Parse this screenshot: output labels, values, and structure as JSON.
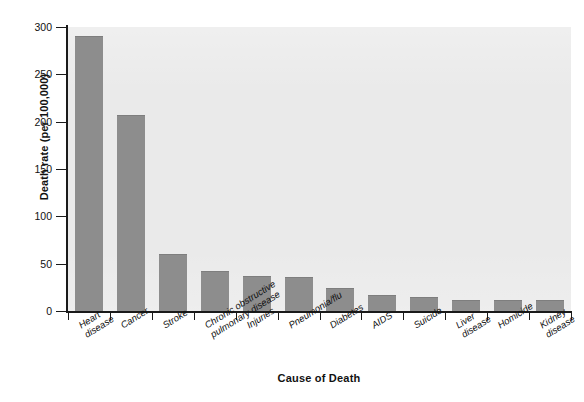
{
  "chart_data": {
    "type": "bar",
    "title": "",
    "xlabel": "Cause of Death",
    "ylabel": "Death rate (per 100,000)",
    "categories": [
      "Heart\ndisease",
      "Cancer",
      "Stroke",
      "Chronic obstructive\npulmonary disease",
      "Injuries",
      "Pneumonia/flu",
      "Diabetes",
      "AIDS",
      "Suicide",
      "Liver\ndisease",
      "Homicide",
      "Kidney\ndisease"
    ],
    "values": [
      290,
      207,
      60,
      42,
      37,
      36,
      24,
      17,
      15,
      12,
      12,
      12
    ],
    "ylim": [
      0,
      300
    ],
    "yticks": [
      0,
      50,
      100,
      150,
      200,
      250,
      300
    ],
    "ytick_labels": [
      "0",
      "50",
      "100",
      "150",
      "200",
      "250",
      "300"
    ],
    "grid": false,
    "legend": "none",
    "bar_color": "#8d8d8d",
    "plot_background": "#eaeaea",
    "axis_color": "#1a1a1a",
    "text_color": "#111111"
  }
}
